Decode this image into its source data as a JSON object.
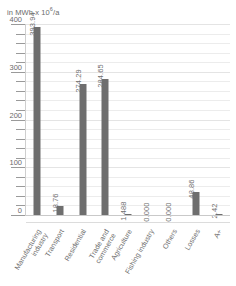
{
  "chart_data": {
    "type": "bar",
    "title": "",
    "subtitle": "",
    "unit_caption": "in MWh x 10",
    "unit_exponent": "6",
    "unit_suffix": "/a",
    "xlabel": "",
    "ylabel": "in MWh x 10⁶/a",
    "ylim": [
      0,
      400
    ],
    "ytick_major": [
      400,
      300,
      200,
      100,
      0
    ],
    "ytick_minor_step": 20,
    "grid": true,
    "legend": "none",
    "categories": [
      "Manufacturing industry",
      "Transport",
      "Residential",
      "Trade and commerce",
      "Agriculture",
      "Fishing industry",
      "Others",
      "Losses",
      "A+"
    ],
    "category_lines": [
      [
        "Manufacturing",
        "industry"
      ],
      [
        "Transport",
        ""
      ],
      [
        "Residential",
        ""
      ],
      [
        "Trade and",
        "commerce"
      ],
      [
        "Agriculture",
        ""
      ],
      [
        "Fishing industry",
        ""
      ],
      [
        "Others",
        ""
      ],
      [
        "Losses",
        ""
      ],
      [
        "A+",
        ""
      ]
    ],
    "values": [
      393.94,
      18.76,
      274.29,
      284.65,
      1.488,
      0.0,
      0.0,
      48.86,
      2.42
    ],
    "value_labels": [
      "393.94",
      "18.76",
      "274.29",
      "284.65",
      "1.488",
      "0.000",
      "0.000",
      "48.86",
      "2.42"
    ],
    "bar_color": "#6e6e6e",
    "grid_color": "#ececec",
    "text_color": "#6f6f6f"
  },
  "axis": {
    "y_labels": [
      "400",
      "300",
      "200",
      "100",
      "0"
    ]
  }
}
